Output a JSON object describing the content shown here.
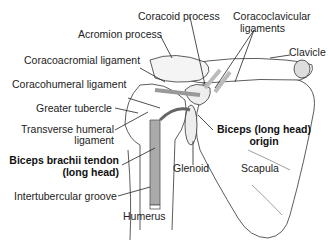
{
  "diagram": {
    "labels": {
      "coracoid_process": "Coracoid process",
      "acromion_process": "Acromion process",
      "coracoclavicular_ligaments_1": "Coracoclavicular",
      "coracoclavicular_ligaments_2": "ligaments",
      "clavicle": "Clavicle",
      "coracoacromial_ligament": "Coracoacromial ligament",
      "coracohumeral_ligament": "Coracohumeral ligament",
      "greater_tubercle": "Greater tubercle",
      "transverse_humeral_ligament_1": "Transverse humeral",
      "transverse_humeral_ligament_2": "ligament",
      "biceps_brachii_tendon_1": "Biceps brachii tendon",
      "biceps_brachii_tendon_2": "(long head)",
      "biceps_origin_1": "Biceps (long head)",
      "biceps_origin_2": "origin",
      "glenoid": "Glenoid",
      "scapula": "Scapula",
      "intertubercular_groove": "Intertubercular groove",
      "humerus": "Humerus"
    }
  }
}
